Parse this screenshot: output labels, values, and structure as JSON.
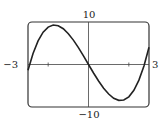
{
  "chart_data": {
    "type": "line",
    "title": "",
    "xlabel": "",
    "ylabel": "",
    "xlim": [
      -3,
      3
    ],
    "ylim": [
      -10,
      10
    ],
    "grid": false,
    "legend": null,
    "tick_labels": {
      "x_min": "−3",
      "x_max": "3",
      "y_max": "10",
      "y_min": "−10"
    },
    "x_ticks": [
      -2,
      2
    ],
    "series": [
      {
        "name": "f(x)",
        "x": [
          -3,
          -2.75,
          -2.5,
          -2.25,
          -2,
          -1.75,
          -1.5,
          -1.25,
          -1,
          -0.75,
          -0.5,
          -0.25,
          0,
          0.25,
          0.5,
          0.75,
          1,
          1.25,
          1.5,
          1.75,
          2,
          2.25,
          2.5,
          2.75,
          3
        ],
        "y": [
          -1.35,
          2.61,
          5.56,
          7.6,
          8.8,
          9.28,
          9.11,
          8.41,
          7.25,
          5.74,
          3.96,
          2.02,
          0,
          -2.0,
          -3.88,
          -5.58,
          -6.95,
          -7.95,
          -8.43,
          -8.36,
          -7.6,
          -6.08,
          -3.68,
          -0.35,
          4.05
        ]
      }
    ]
  }
}
